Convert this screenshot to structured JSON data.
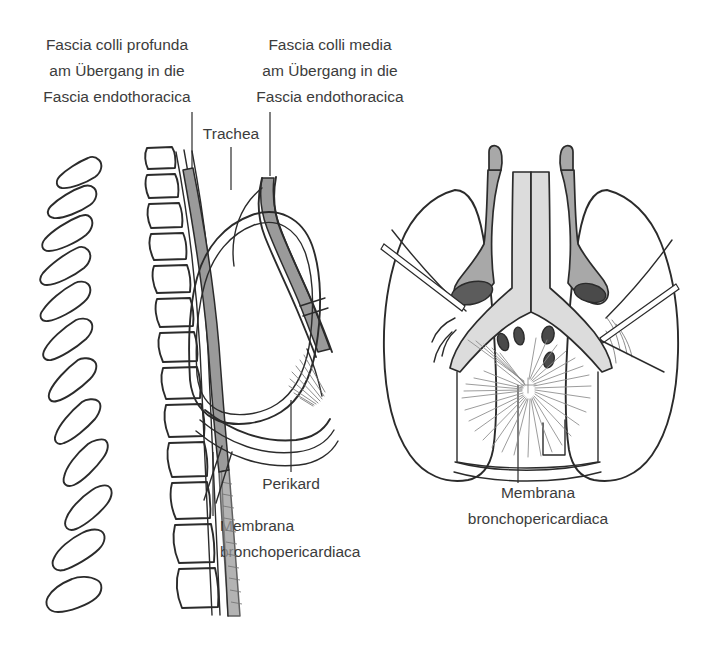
{
  "figure": {
    "background_color": "#ffffff",
    "line_color": "#2b2b2b",
    "text_color": "#3c3c3c",
    "fascia_color": "#9a9a9a",
    "organ_color": "#a8a8a8",
    "lumen_color": "#5c5c5c",
    "width": 726,
    "height": 657
  },
  "labels": {
    "fascia_colli_profunda": {
      "line1": "Fascia colli profunda",
      "line2": "am Übergang in die",
      "line3": "Fascia endothoracica"
    },
    "fascia_colli_media": {
      "line1": "Fascia colli media",
      "line2": "am Übergang in die",
      "line3": "Fascia endothoracica"
    },
    "trachea": "Trachea",
    "perikard": "Perikard",
    "membrana_left": {
      "line1": "Membrana",
      "line2": "bronchopericardiaca"
    },
    "membrana_right": {
      "line1": "Membrana",
      "line2": "bronchopericardiaca"
    }
  },
  "panels": {
    "left": {
      "name": "Sagittal section of thorax with vertebral column, trachea and pericardium"
    },
    "right": {
      "name": "Frontal view of lungs with bronchopericardial membrane"
    }
  }
}
